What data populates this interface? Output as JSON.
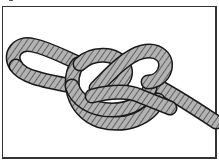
{
  "illustration": {
    "subject": "rope knot (figure-eight loop style)",
    "style": "black-outlined line drawing with gray twisted rope strands",
    "colors": {
      "background": "#ffffff",
      "frame": "#333333",
      "rope_fill": "#b3b3b3",
      "rope_outline": "#1a1a1a"
    }
  }
}
